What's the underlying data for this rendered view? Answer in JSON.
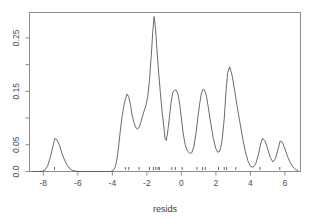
{
  "chart_data": {
    "type": "line",
    "title": "",
    "subtitle": "",
    "xlabel": "resids",
    "ylabel": "",
    "grid": false,
    "legend": null,
    "xlim": [
      -8.8,
      6.9
    ],
    "ylim": [
      0.0,
      0.2975
    ],
    "xticks": [
      -8,
      -6,
      -4,
      -2,
      0,
      2,
      4,
      6
    ],
    "xtick_labels": [
      "-8",
      "-6",
      "-4",
      "-2",
      "0",
      "2",
      "4",
      "6"
    ],
    "yticks": [
      0.0,
      0.05,
      0.15,
      0.25
    ],
    "ytick_labels": [
      "0.0",
      "0.05",
      "0.15",
      "0.25"
    ],
    "ytick_minor": [
      0.1,
      0.2
    ],
    "series": [
      {
        "name": "density",
        "x": [
          -8.6,
          -8.4,
          -8.2,
          -8.05,
          -7.9,
          -7.75,
          -7.6,
          -7.45,
          -7.33,
          -7.2,
          -7.05,
          -6.9,
          -6.75,
          -6.6,
          -6.45,
          -6.3,
          -6.15,
          -6.0,
          -5.8,
          -5.55,
          -5.2,
          -4.8,
          -4.4,
          -4.1,
          -3.95,
          -3.85,
          -3.75,
          -3.65,
          -3.55,
          -3.45,
          -3.35,
          -3.25,
          -3.15,
          -3.05,
          -2.95,
          -2.85,
          -2.75,
          -2.65,
          -2.55,
          -2.45,
          -2.35,
          -2.25,
          -2.15,
          -2.05,
          -1.95,
          -1.85,
          -1.75,
          -1.65,
          -1.58,
          -1.5,
          -1.42,
          -1.32,
          -1.22,
          -1.12,
          -1.02,
          -0.95,
          -0.88,
          -0.8,
          -0.7,
          -0.6,
          -0.5,
          -0.4,
          -0.3,
          -0.2,
          -0.1,
          0.0,
          0.1,
          0.22,
          0.35,
          0.48,
          0.6,
          0.72,
          0.85,
          0.95,
          1.05,
          1.15,
          1.25,
          1.35,
          1.45,
          1.55,
          1.7,
          1.85,
          1.98,
          2.1,
          2.22,
          2.35,
          2.48,
          2.58,
          2.68,
          2.8,
          2.95,
          3.1,
          3.25,
          3.4,
          3.55,
          3.7,
          3.85,
          4.0,
          4.15,
          4.3,
          4.45,
          4.58,
          4.7,
          4.85,
          5.0,
          5.15,
          5.3,
          5.45,
          5.6,
          5.72,
          5.85,
          6.0,
          6.15,
          6.3,
          6.45,
          6.6,
          6.75
        ],
        "y": [
          0.0,
          0.0,
          0.0,
          0.001,
          0.003,
          0.01,
          0.026,
          0.046,
          0.062,
          0.059,
          0.048,
          0.032,
          0.02,
          0.011,
          0.005,
          0.002,
          0.001,
          0.0,
          0.0,
          0.0,
          0.0,
          0.0,
          0.0,
          0.0,
          0.002,
          0.007,
          0.02,
          0.043,
          0.073,
          0.1,
          0.12,
          0.135,
          0.145,
          0.14,
          0.125,
          0.105,
          0.092,
          0.083,
          0.079,
          0.083,
          0.092,
          0.104,
          0.114,
          0.124,
          0.14,
          0.17,
          0.215,
          0.265,
          0.29,
          0.268,
          0.23,
          0.186,
          0.148,
          0.113,
          0.085,
          0.062,
          0.058,
          0.072,
          0.1,
          0.128,
          0.148,
          0.152,
          0.152,
          0.145,
          0.126,
          0.1,
          0.072,
          0.05,
          0.038,
          0.034,
          0.035,
          0.046,
          0.072,
          0.1,
          0.125,
          0.145,
          0.154,
          0.152,
          0.141,
          0.122,
          0.09,
          0.062,
          0.044,
          0.036,
          0.038,
          0.056,
          0.098,
          0.148,
          0.185,
          0.196,
          0.178,
          0.148,
          0.118,
          0.09,
          0.062,
          0.038,
          0.02,
          0.01,
          0.008,
          0.014,
          0.03,
          0.05,
          0.062,
          0.057,
          0.042,
          0.026,
          0.018,
          0.024,
          0.042,
          0.057,
          0.055,
          0.042,
          0.028,
          0.017,
          0.009,
          0.004,
          0.002
        ]
      }
    ],
    "rug": {
      "name": "rug-marks",
      "values": [
        -7.35,
        -3.25,
        -3.05,
        -2.45,
        -1.85,
        -1.62,
        -1.48,
        -1.35,
        -1.28,
        -0.55,
        -0.35,
        0.05,
        0.9,
        1.22,
        1.38,
        2.15,
        2.48,
        2.62,
        3.15,
        4.55,
        5.7
      ]
    }
  },
  "axis": {
    "x_title": "resids"
  },
  "colors": {
    "curve": "#5a5a5a",
    "box": "#8c8c8c",
    "text": "#4d4d4d",
    "rug": "#555555",
    "background": "#ffffff"
  }
}
